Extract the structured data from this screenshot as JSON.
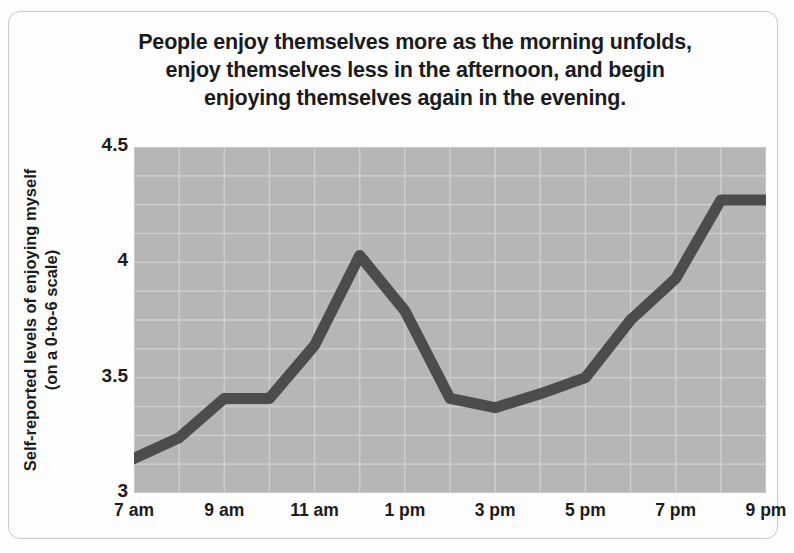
{
  "title": {
    "line1": "People enjoy themselves more as the morning unfolds,",
    "line2": "enjoy themselves less in the afternoon, and begin",
    "line3": "enjoying themselves again in the evening."
  },
  "axis": {
    "ylabel_line1": "Self-reported levels of enjoying myself",
    "ylabel_line2": "(on a 0-to-6 scale)"
  },
  "colors": {
    "plot_background": "#b6b6b6",
    "gridline": "#cfcfcf",
    "line": "#4c4c4c",
    "text": "#1b1b1b",
    "frame_border": "#c9c9c9",
    "page_background": "#fdfdfd"
  },
  "chart_data": {
    "type": "line",
    "title": "People enjoy themselves more as the morning unfolds, enjoy themselves less in the afternoon, and begin enjoying themselves again in the evening.",
    "xlabel": "",
    "ylabel": "Self-reported levels of enjoying myself (on a 0-to-6 scale)",
    "x": [
      7,
      8,
      9,
      10,
      11,
      12,
      13,
      14,
      15,
      16,
      17,
      18,
      19,
      20,
      21
    ],
    "xticklabels": [
      "7 am",
      "9 am",
      "11 am",
      "1 pm",
      "3 pm",
      "5 pm",
      "7 pm",
      "9 pm"
    ],
    "xtickvalues": [
      7,
      9,
      11,
      13,
      15,
      17,
      19,
      21
    ],
    "yticklabels": [
      "4.5",
      "4",
      "3.5",
      "3"
    ],
    "ytickvalues": [
      4.5,
      4,
      3.5,
      3
    ],
    "ylim": [
      3,
      4.5
    ],
    "xlim": [
      7,
      21
    ],
    "grid": true,
    "legend": "none",
    "series": [
      {
        "name": "Self-reported enjoyment",
        "values": [
          3.15,
          3.24,
          3.41,
          3.41,
          3.64,
          4.03,
          3.79,
          3.41,
          3.37,
          3.43,
          3.5,
          3.75,
          3.93,
          4.27,
          4.27
        ]
      }
    ]
  }
}
